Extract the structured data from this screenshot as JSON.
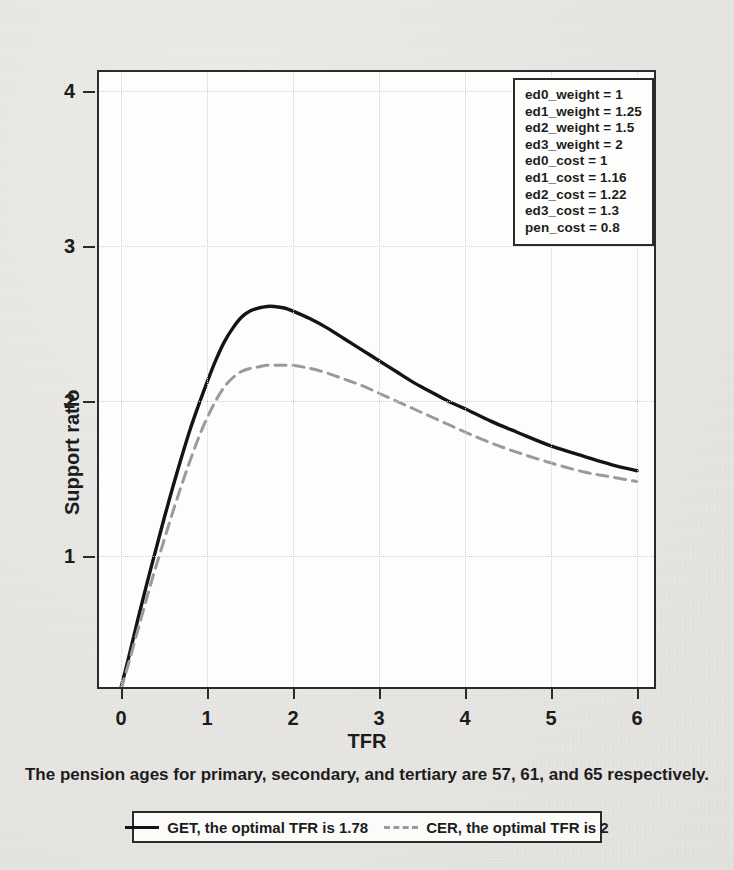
{
  "chart_data": {
    "type": "line",
    "title": "",
    "xlabel": "TFR",
    "ylabel": "Support ratio",
    "xlim": [
      -0.03,
      6.24
    ],
    "ylim": [
      0.0,
      4.23
    ],
    "xticks": [
      0,
      1,
      2,
      3,
      4,
      5,
      6
    ],
    "yticks": [
      1,
      2,
      3,
      4
    ],
    "xtick_labels": [
      "0",
      "1",
      "2",
      "3",
      "4",
      "5",
      "6"
    ],
    "ytick_labels": [
      "1",
      "2",
      "3",
      "4"
    ],
    "grid": true,
    "legend_position": "below-figure",
    "series": [
      {
        "name": "GET",
        "style": "solid",
        "color": "#141414",
        "optimal_tfr": 1.78,
        "peak_value": 2.61,
        "x": [
          0.0,
          0.1,
          0.2,
          0.3,
          0.4,
          0.5,
          0.6,
          0.7,
          0.8,
          0.9,
          1.0,
          1.1,
          1.2,
          1.3,
          1.4,
          1.5,
          1.6,
          1.7,
          1.78,
          1.9,
          2.0,
          2.2,
          2.4,
          2.6,
          2.8,
          3.0,
          3.2,
          3.4,
          3.6,
          3.8,
          4.0,
          4.3,
          4.6,
          5.0,
          5.4,
          5.7,
          6.0
        ],
        "y": [
          0.15,
          0.37,
          0.6,
          0.82,
          1.03,
          1.24,
          1.44,
          1.63,
          1.81,
          1.97,
          2.12,
          2.26,
          2.38,
          2.47,
          2.54,
          2.58,
          2.6,
          2.61,
          2.61,
          2.6,
          2.58,
          2.53,
          2.47,
          2.4,
          2.33,
          2.26,
          2.19,
          2.12,
          2.06,
          2.0,
          1.95,
          1.87,
          1.8,
          1.71,
          1.64,
          1.59,
          1.55
        ]
      },
      {
        "name": "CER",
        "style": "dashed",
        "color": "#9a9a9a",
        "optimal_tfr": 2,
        "peak_value": 2.23,
        "x": [
          0.0,
          0.1,
          0.2,
          0.3,
          0.4,
          0.5,
          0.6,
          0.7,
          0.8,
          0.9,
          1.0,
          1.1,
          1.2,
          1.3,
          1.4,
          1.5,
          1.6,
          1.7,
          1.8,
          1.9,
          2.0,
          2.2,
          2.4,
          2.6,
          2.8,
          3.0,
          3.2,
          3.4,
          3.6,
          3.8,
          4.0,
          4.3,
          4.6,
          5.0,
          5.4,
          5.7,
          6.0
        ],
        "y": [
          0.14,
          0.33,
          0.53,
          0.73,
          0.92,
          1.1,
          1.28,
          1.45,
          1.61,
          1.76,
          1.89,
          2.0,
          2.09,
          2.15,
          2.19,
          2.21,
          2.22,
          2.23,
          2.23,
          2.23,
          2.23,
          2.21,
          2.18,
          2.14,
          2.1,
          2.05,
          2.0,
          1.95,
          1.9,
          1.85,
          1.8,
          1.73,
          1.67,
          1.6,
          1.54,
          1.51,
          1.48
        ]
      }
    ]
  },
  "annotation_box": {
    "lines": [
      "ed0_weight = 1",
      "ed1_weight = 1.25",
      "ed2_weight = 1.5",
      "ed3_weight = 2",
      "ed0_cost = 1",
      "ed1_cost = 1.16",
      "ed2_cost = 1.22",
      "ed3_cost = 1.3",
      "pen_cost = 0.8"
    ]
  },
  "caption": {
    "text": "The pension ages for primary, secondary, and tertiary are 57, 61, and 65 respectively."
  },
  "legend": {
    "entries": [
      {
        "key": "solid-line",
        "label": "GET, the optimal TFR is 1.78"
      },
      {
        "key": "dashed-line",
        "label": "CER, the optimal TFR is 2"
      }
    ]
  },
  "colors": {
    "get_line": "#141414",
    "cer_line": "#9a9a9a",
    "frame": "#2b2b2b",
    "grid": "#cfcfcb",
    "page_background": "#e8e7e4",
    "plot_background": "#fdfdfc"
  }
}
